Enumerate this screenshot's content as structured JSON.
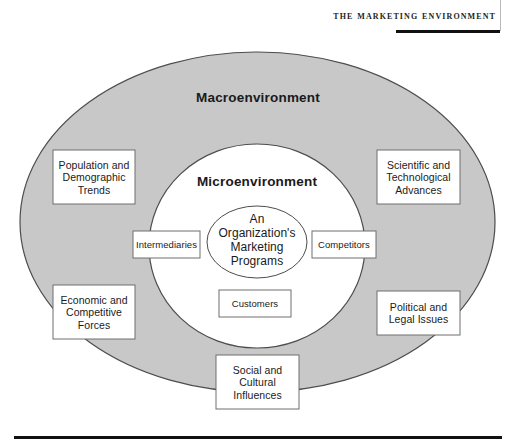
{
  "header": {
    "running_head": "The Marketing Environment"
  },
  "figure": {
    "macro_ring_label": "Macroenvironment",
    "micro_ring_label": "Microenvironment",
    "core_label": "An\nOrganization's\nMarketing\nPrograms",
    "macro_boxes": [
      {
        "id": "population-demographic-trends",
        "label": "Population and\nDemographic\nTrends"
      },
      {
        "id": "scientific-technological-advances",
        "label": "Scientific and\nTechnological\nAdvances"
      },
      {
        "id": "economic-competitive-forces",
        "label": "Economic and\nCompetitive\nForces"
      },
      {
        "id": "political-legal-issues",
        "label": "Political and\nLegal Issues"
      },
      {
        "id": "social-cultural-influences",
        "label": "Social and\nCultural\nInfluences"
      }
    ],
    "micro_boxes": [
      {
        "id": "intermediaries",
        "label": "Intermediaries"
      },
      {
        "id": "competitors",
        "label": "Competitors"
      },
      {
        "id": "customers",
        "label": "Customers"
      }
    ]
  },
  "colors": {
    "macro_fill": "#c8c8c8",
    "micro_fill": "#ffffff",
    "stroke": "#4d4d4d",
    "box_border": "#6e6e6e",
    "rule": "#111111",
    "text": "#1a1a1a"
  }
}
